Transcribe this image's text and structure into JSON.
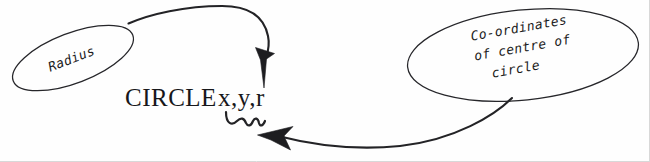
{
  "diagram": {
    "kind": "annotated-syntax-callout",
    "background_color": "#fefefe",
    "ink_color": "#1d1d20",
    "command": {
      "keyword": "CIRCLE",
      "arguments": "x,y,r",
      "full_text": "CIRCLE x,y,r"
    },
    "callouts": [
      {
        "id": "radius",
        "label": "Radius",
        "lines": [
          "Radius"
        ],
        "shape": "ellipse",
        "rotation_deg": -22,
        "points_to": "r"
      },
      {
        "id": "coordinates",
        "label": "Co-ordinates of centre of circle",
        "lines": [
          "Co-ordinates",
          "of centre of",
          "circle"
        ],
        "shape": "ellipse",
        "rotation_deg": -10,
        "points_to": "x,y"
      }
    ],
    "annotations": [
      {
        "id": "radius-arrow",
        "type": "curved-arrow",
        "from": "radius",
        "to": "r",
        "direction": "down"
      },
      {
        "id": "coordinates-arrow",
        "type": "curved-arrow",
        "from": "coordinates",
        "to": "x,y",
        "direction": "left"
      },
      {
        "id": "xy-squiggle",
        "type": "squiggly-underline",
        "under": "x,y"
      }
    ]
  }
}
